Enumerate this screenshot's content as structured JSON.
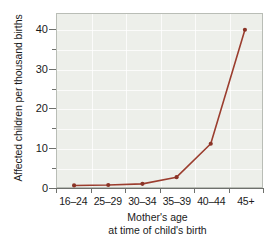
{
  "chart_data": {
    "type": "line",
    "title": "",
    "xlabel": "Mother's age at time of child's birth",
    "ylabel": "Affected children per thousand births",
    "categories": [
      "16–24",
      "25–29",
      "30–34",
      "35–39",
      "40–44",
      "45+"
    ],
    "values": [
      0.4,
      0.5,
      0.8,
      2.5,
      11,
      40
    ],
    "series": [
      {
        "name": "Affected children per thousand births",
        "values": [
          0.4,
          0.5,
          0.8,
          2.5,
          11,
          40
        ]
      }
    ],
    "ylim": [
      0,
      44
    ],
    "xlim": [
      0,
      5
    ],
    "yticks": [
      0,
      10,
      20,
      30,
      40
    ],
    "yticklabels": [
      "0",
      "10",
      "20",
      "30",
      "40"
    ],
    "yminorticks": [
      5,
      15,
      25,
      35
    ],
    "xticklabels": [
      "16–24",
      "25–29",
      "30–34",
      "35–39",
      "40–44",
      "45+"
    ],
    "grid": true,
    "legend": false,
    "legend_position": "none",
    "marker": "circle",
    "line_color": "#9b3d2e",
    "marker_color": "#8a3326",
    "plot_background": "#edefea",
    "gridline_color": "#ffffff",
    "axis_color": "#6e706c",
    "text_color": "#1a1a1a"
  },
  "axes": {
    "y_title": "Affected children per thousand births",
    "x_title_line1": "Mother's age",
    "x_title_line2": "at time of child's birth"
  }
}
